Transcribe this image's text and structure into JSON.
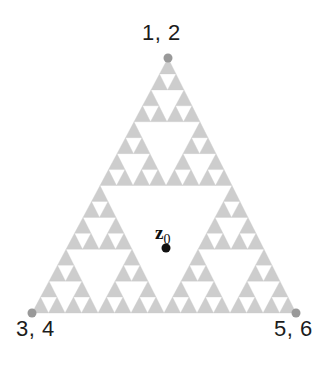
{
  "figure": {
    "name": "sierpinski-triangle-diagram",
    "background_color": "#ffffff",
    "fractal_color": "#cdcdcd",
    "vertex_dot_color": "#999999",
    "point_dot_color": "#111111",
    "label_color": "#1c1c1c",
    "recursion_depth": 4
  },
  "labels": {
    "apex": "1, 2",
    "bottom_left": "3, 4",
    "bottom_right": "5, 6",
    "interior_point": "z",
    "interior_point_subscript": "0"
  },
  "geometry": {
    "apex": {
      "x": 168,
      "y": 58
    },
    "bottom_left": {
      "x": 32,
      "y": 313
    },
    "bottom_right": {
      "x": 296,
      "y": 313
    },
    "interior_point": {
      "x": 166,
      "y": 248
    },
    "vertex_dot_radius": 4.5,
    "interior_dot_radius": 4.5
  },
  "chart_data": {
    "type": "scatter",
    "title": "",
    "xlabel": "",
    "ylabel": "",
    "vertices": [
      {
        "label": "1, 2",
        "x": 168,
        "y": 58,
        "position": "apex"
      },
      {
        "label": "3, 4",
        "x": 32,
        "y": 313,
        "position": "bottom-left"
      },
      {
        "label": "5, 6",
        "x": 296,
        "y": 313,
        "position": "bottom-right"
      }
    ],
    "points": [
      {
        "label": "z0",
        "x": 166,
        "y": 248
      }
    ],
    "fractal": {
      "kind": "sierpinski-gasket",
      "depth": 4,
      "filled_triangles": 81,
      "smallest_triangles_per_edge": 16
    },
    "grid": false,
    "legend": "none"
  }
}
